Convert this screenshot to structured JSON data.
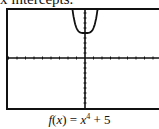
{
  "header": {
    "text": "x intercepts."
  },
  "caption": {
    "fname": "f",
    "var": "x",
    "equals": "= ",
    "base": "x",
    "exp": "4",
    "rest": " + 5",
    "full": "f(x) = x⁴ + 5"
  },
  "chart_data": {
    "type": "line",
    "function": "x^4 + 5",
    "xlabel": "",
    "ylabel": "",
    "xlim": [
      -10,
      10
    ],
    "ylim": [
      -10,
      10
    ],
    "grid": false,
    "tick_step": 1,
    "series": [
      {
        "name": "f(x)",
        "x": [
          -1.6,
          -1.4,
          -1.2,
          -1,
          -0.5,
          0,
          0.5,
          1,
          1.2,
          1.4,
          1.6
        ],
        "values": [
          11.55,
          8.84,
          7.07,
          6,
          5.06,
          5,
          5.06,
          6,
          7.07,
          8.84,
          11.55
        ]
      }
    ],
    "x_intercepts": []
  }
}
